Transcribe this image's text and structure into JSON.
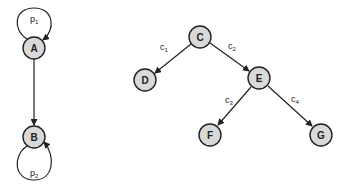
{
  "diagram": {
    "left_graph": {
      "nodes": [
        {
          "id": "A",
          "label": "A",
          "x": 34,
          "y": 48
        },
        {
          "id": "B",
          "label": "B",
          "x": 34,
          "y": 137
        }
      ],
      "edges": [
        {
          "from": "A",
          "to": "A",
          "label": "p",
          "sub": "1",
          "type": "self-loop-top"
        },
        {
          "from": "A",
          "to": "B",
          "label": "",
          "type": "directed"
        },
        {
          "from": "B",
          "to": "B",
          "label": "p",
          "sub": "2",
          "type": "self-loop-bottom"
        }
      ]
    },
    "right_graph": {
      "nodes": [
        {
          "id": "C",
          "label": "C",
          "x": 200,
          "y": 37
        },
        {
          "id": "D",
          "label": "D",
          "x": 145,
          "y": 80
        },
        {
          "id": "E",
          "label": "E",
          "x": 259,
          "y": 78
        },
        {
          "id": "F",
          "label": "F",
          "x": 210,
          "y": 135
        },
        {
          "id": "G",
          "label": "G",
          "x": 321,
          "y": 135
        }
      ],
      "edges": [
        {
          "from": "C",
          "to": "D",
          "label": "c",
          "sub": "1"
        },
        {
          "from": "C",
          "to": "E",
          "label": "c",
          "sub": "2"
        },
        {
          "from": "E",
          "to": "F",
          "label": "c",
          "sub": "3"
        },
        {
          "from": "E",
          "to": "G",
          "label": "c",
          "sub": "4"
        }
      ]
    },
    "colors": {
      "node_fill": "#d9d9d9",
      "stroke": "#222222",
      "background": "#ffffff"
    }
  }
}
